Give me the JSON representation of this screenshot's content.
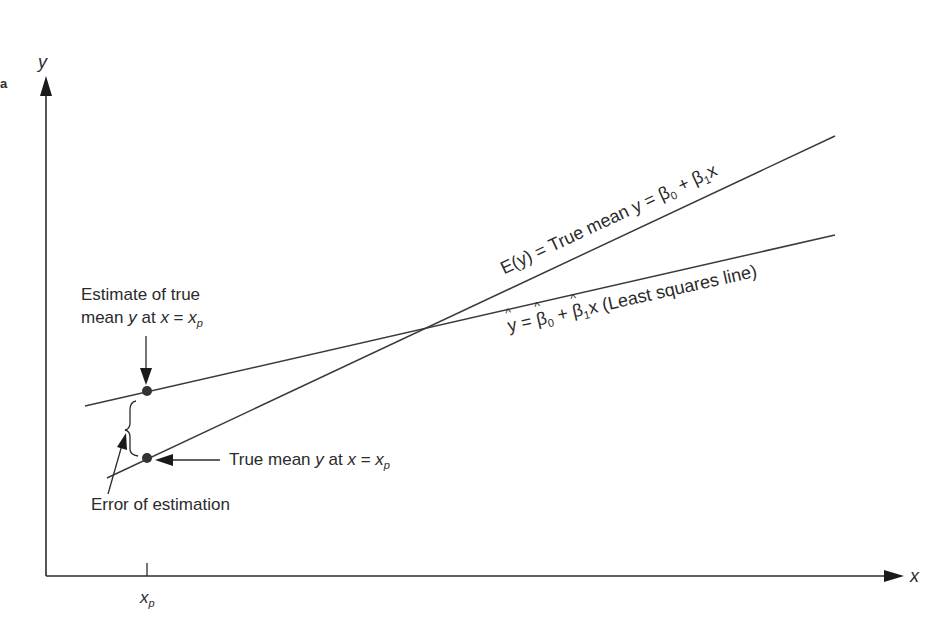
{
  "figure": {
    "axes": {
      "x_label": "x",
      "y_label": "y",
      "x_tick_label": "x",
      "x_tick_sub": "p",
      "left_edge_mark": "a"
    },
    "lines": {
      "true_mean": {
        "label_prefix": "E(y) = True mean y = ",
        "beta0": "β",
        "beta0_sub": "0",
        "plus": " + ",
        "beta1": "β",
        "beta1_sub": "1",
        "x": "x"
      },
      "least_squares": {
        "yhat": "y",
        "eq": " = ",
        "beta0": "β",
        "beta0_sub": "0",
        "plus": " + ",
        "beta1": "β",
        "beta1_sub": "1",
        "suffix": "x (Least squares line)"
      }
    },
    "annotations": {
      "estimate_line1": "Estimate of true",
      "estimate_line2_a": "mean ",
      "estimate_line2_y": "y",
      "estimate_line2_b": " at ",
      "estimate_line2_x": "x",
      "estimate_line2_eq": " =  ",
      "estimate_line2_xp": "x",
      "estimate_line2_sub": "p",
      "true_mean_a": "True mean ",
      "true_mean_y": "y",
      "true_mean_b": " at ",
      "true_mean_x": "x",
      "true_mean_eq": " =  ",
      "true_mean_xp": "x",
      "true_mean_sub": "p",
      "error": "Error of estimation"
    },
    "colors": {
      "ink": "#2b2b2b",
      "background": "#ffffff"
    }
  }
}
